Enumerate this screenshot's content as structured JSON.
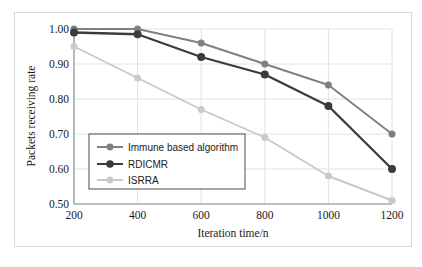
{
  "chart_data": {
    "type": "line",
    "title": "",
    "xlabel": "Iteration time/n",
    "ylabel": "Packets receiving rate",
    "x": [
      200,
      400,
      600,
      800,
      1000,
      1200
    ],
    "xtick_labels": [
      "200",
      "400",
      "600",
      "800",
      "1000",
      "1200"
    ],
    "ytick_labels": [
      "0.50",
      "0.60",
      "0.70",
      "0.80",
      "0.90",
      "1.00"
    ],
    "ytick_values": [
      0.5,
      0.6,
      0.7,
      0.8,
      0.9,
      1.0
    ],
    "xlim": [
      200,
      1200
    ],
    "ylim": [
      0.5,
      1.0
    ],
    "grid": "both",
    "legend_position": "lower-left-inside",
    "series": [
      {
        "name": "Immune based algorithm",
        "color": "#808080",
        "marker": "circle",
        "values": [
          1.0,
          1.0,
          0.96,
          0.9,
          0.84,
          0.7
        ]
      },
      {
        "name": "RDICMR",
        "color": "#3b3b3b",
        "marker": "circle",
        "values": [
          0.99,
          0.985,
          0.92,
          0.87,
          0.78,
          0.6
        ]
      },
      {
        "name": "ISRRA",
        "color": "#c9c9c9",
        "marker": "circle",
        "values": [
          0.95,
          0.86,
          0.77,
          0.69,
          0.58,
          0.51
        ]
      }
    ]
  },
  "axis": {
    "x_title": "Iteration time/n",
    "y_title": "Packets receiving rate",
    "x_ticks": [
      "200",
      "400",
      "600",
      "800",
      "1000",
      "1200"
    ],
    "y_ticks": [
      "1.00",
      "0.90",
      "0.80",
      "0.70",
      "0.60",
      "0.50"
    ]
  },
  "legend": {
    "items": [
      {
        "label": "Immune based algorithm",
        "color": "#808080"
      },
      {
        "label": "RDICMR",
        "color": "#3b3b3b"
      },
      {
        "label": "ISRRA",
        "color": "#c9c9c9"
      }
    ]
  }
}
